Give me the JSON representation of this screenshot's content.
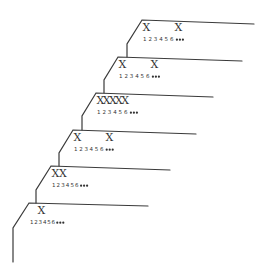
{
  "diagram": {
    "cell_labels": [
      "1",
      "2",
      "3",
      "4",
      "5",
      "6"
    ],
    "ellipsis": "•••",
    "mark_symbol": "X",
    "layers": [
      {
        "name": "layer-1",
        "marked_cells": [
          1,
          5
        ]
      },
      {
        "name": "layer-2",
        "marked_cells": [
          1,
          5
        ]
      },
      {
        "name": "layer-3",
        "marked_cells": [
          1,
          2,
          3,
          4,
          5
        ]
      },
      {
        "name": "layer-4",
        "marked_cells": [
          1,
          5
        ]
      },
      {
        "name": "layer-5",
        "marked_cells": [
          1,
          2
        ]
      },
      {
        "name": "layer-6",
        "marked_cells": [
          2
        ]
      }
    ],
    "colors": {
      "line": "#3a3a3a",
      "text": "#333333",
      "background": "#ffffff"
    }
  }
}
